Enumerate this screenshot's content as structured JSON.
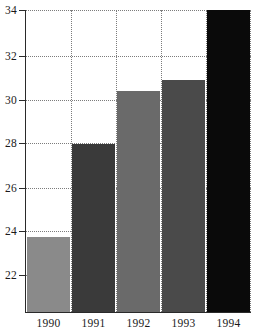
{
  "chart_data": {
    "type": "bar",
    "title": "",
    "subtitle": "",
    "xlabel": "",
    "ylabel": "",
    "categories": [
      "1990",
      "1991",
      "1992",
      "1993",
      "1994"
    ],
    "values": [
      24.25,
      28.25,
      30.5,
      31.0,
      34.0
    ],
    "series": [
      {
        "name": "",
        "values": [
          24.25,
          28.25,
          30.5,
          31.0,
          34.0
        ]
      }
    ],
    "bar_colors": [
      "#8a8a8a",
      "#3a3a3a",
      "#6a6a6a",
      "#4a4a4a",
      "#0a0a0a"
    ],
    "ylim": [
      21.0,
      34.0
    ],
    "yticks": [
      22,
      24,
      26,
      28,
      30,
      32,
      34
    ],
    "ytick_labels": [
      "22",
      "24",
      "26",
      "28",
      "30",
      "32",
      "34"
    ],
    "xtick_labels": [
      "1990",
      "1991",
      "1992",
      "1993",
      "1994"
    ],
    "grid": true,
    "grid_style": "dotted",
    "grid_color": "#7c7c7c",
    "legend": false,
    "legend_position": "none",
    "axis_color": "#2a2a2a",
    "background_color": "#ffffff",
    "annotations": []
  }
}
